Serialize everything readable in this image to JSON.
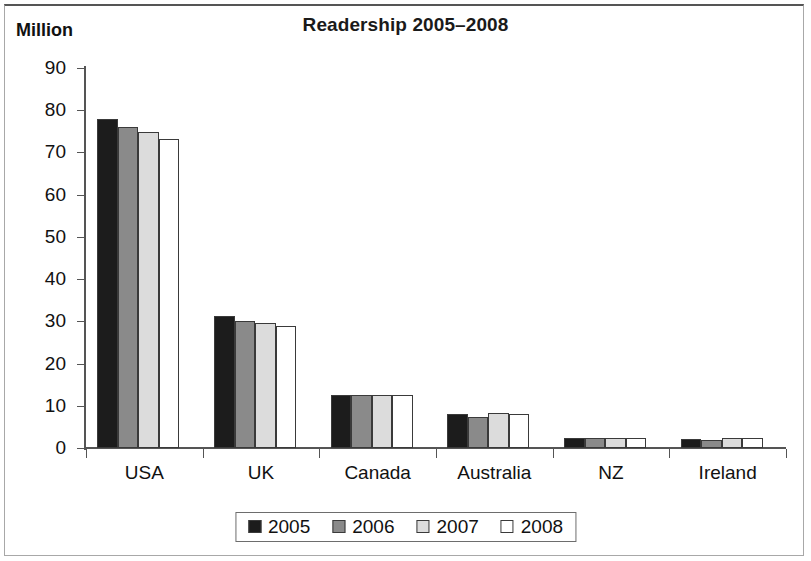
{
  "figure": {
    "unit_label": "Million"
  },
  "chart_data": {
    "type": "bar",
    "title": "Readership 2005–2008",
    "xlabel": "",
    "ylabel": "Million",
    "ylim": [
      0,
      90
    ],
    "ytick_step": 10,
    "yticks": [
      0,
      10,
      20,
      30,
      40,
      50,
      60,
      70,
      80,
      90
    ],
    "grid": false,
    "legend_position": "bottom",
    "categories": [
      "USA",
      "UK",
      "Canada",
      "Australia",
      "NZ",
      "Ireland"
    ],
    "series": [
      {
        "name": "2005",
        "color": "#1c1c1c",
        "values": [
          78,
          31.2,
          12.5,
          8.0,
          2.4,
          2.1
        ]
      },
      {
        "name": "2006",
        "color": "#8a8a8a",
        "values": [
          76,
          30.2,
          12.5,
          7.3,
          2.3,
          2.0
        ]
      },
      {
        "name": "2007",
        "color": "#dcdcdc",
        "values": [
          74.8,
          29.5,
          12.6,
          8.3,
          2.4,
          2.3
        ]
      },
      {
        "name": "2008",
        "color": "#ffffff",
        "values": [
          73.2,
          28.8,
          12.5,
          8.0,
          2.4,
          2.3
        ]
      }
    ]
  }
}
